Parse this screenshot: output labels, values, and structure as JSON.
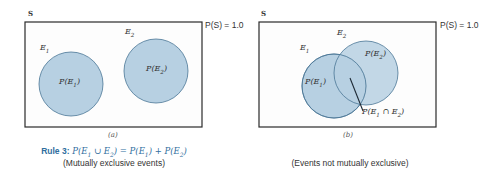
{
  "diagram_a": {
    "space_label": "S",
    "space_prob": "P(S) = 1.0",
    "e1_label": "E1",
    "e2_label": "E2",
    "e1_prob": "P(E1)",
    "e2_prob": "P(E2)",
    "caption": "(a)",
    "rule_keyword": "Rule 3:",
    "rule_formula": "P(E1 ∪ E2) = P(E1) + P(E2)",
    "note": "(Mutually exclusive events)"
  },
  "diagram_b": {
    "space_label": "S",
    "space_prob": "P(S) = 1.0",
    "e1_label": "E1",
    "e2_label": "E2",
    "e1_prob": "P(E1)",
    "e2_prob": "P(E2)",
    "intersection_prob": "P(E1 ∩ E2)",
    "caption": "(b)",
    "note": "(Events not mutually exclusive)"
  },
  "colors": {
    "circle_fill": "#b7d0e2",
    "circle_stroke": "#4a7696",
    "rule_accent": "#2f6e9e",
    "box_stroke": "#2a2a2a"
  }
}
